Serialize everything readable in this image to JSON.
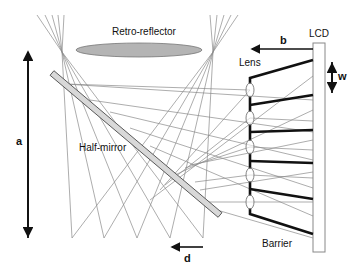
{
  "diagram": {
    "labels": {
      "retro_reflector": "Retro-reflector",
      "half_mirror": "Half-mirror",
      "lens": "Lens",
      "lcd": "LCD",
      "barrier": "Barrier",
      "dim_a": "a",
      "dim_b": "b",
      "dim_d": "d",
      "dim_w": "w"
    },
    "colors": {
      "ray": "#8a8a8a",
      "reflector_fill": "#b4b4b4",
      "mirror_fill": "#d8d8d8",
      "barrier": "#111111",
      "outline": "#666666"
    },
    "components": {
      "retro_reflector": {
        "cx": 139,
        "cy": 50,
        "rx": 63,
        "ry": 7
      },
      "half_mirror": {
        "x1": 52,
        "y1": 73,
        "x2": 220,
        "y2": 215,
        "thickness": 6
      },
      "lcd_panel": {
        "x": 313,
        "y": 43,
        "width": 12,
        "height": 209
      },
      "lens_x": 250,
      "lens_centers_y": [
        90,
        118,
        147,
        175,
        202
      ],
      "focal_points_top": [
        [
          62,
          52
        ],
        [
          213,
          52
        ]
      ],
      "focal_points_bottom_y": 238,
      "focal_points_bottom_x": [
        72,
        104,
        137,
        170,
        203
      ]
    },
    "dimensions": {
      "a": {
        "x": 28,
        "y1": 50,
        "y2": 238
      },
      "b": {
        "y": 49,
        "x1": 250,
        "x2": 313
      },
      "d": {
        "y": 247,
        "x1": 170,
        "x2": 203
      },
      "w": {
        "x": 332,
        "y1": 62,
        "y2": 93
      }
    }
  }
}
